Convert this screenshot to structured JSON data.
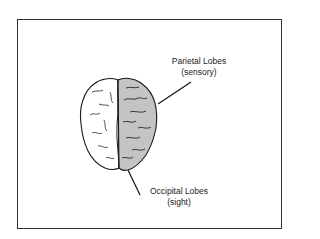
{
  "diagram": {
    "title": "",
    "labels": [
      {
        "id": "parietal",
        "name": "Parietal Lobes",
        "function": "(sensory)"
      },
      {
        "id": "occipital",
        "name": "Occipital Lobes",
        "function": "(sight)"
      }
    ],
    "colors": {
      "frame": "#333333",
      "highlighted_hemisphere": "#c4c4c4",
      "plain_hemisphere": "#ffffff",
      "outline": "#1a1a1a"
    }
  }
}
